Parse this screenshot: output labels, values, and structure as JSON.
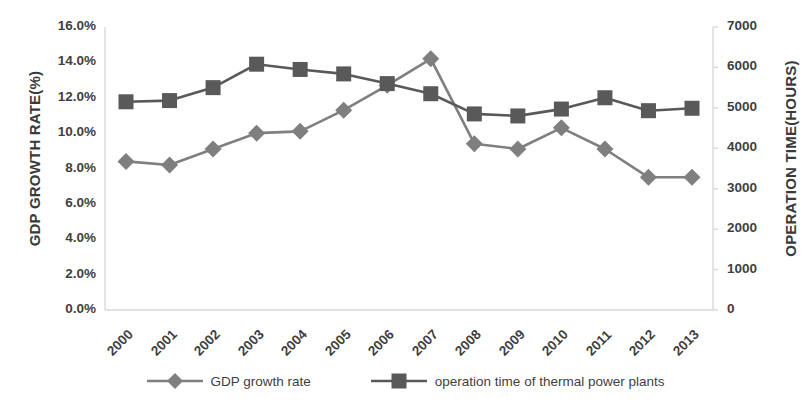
{
  "chart_data": {
    "type": "line",
    "title": "",
    "xlabel": "",
    "categories": [
      "2000",
      "2001",
      "2002",
      "2003",
      "2004",
      "2005",
      "2006",
      "2007",
      "2008",
      "2009",
      "2010",
      "2011",
      "2012",
      "2013"
    ],
    "grid": false,
    "legend_position": "bottom",
    "axes": {
      "left": {
        "label": "GDP GROWTH RATE(%)",
        "ticks": [
          "0.0%",
          "2.0%",
          "4.0%",
          "6.0%",
          "8.0%",
          "10.0%",
          "12.0%",
          "14.0%",
          "16.0%"
        ],
        "tick_values": [
          0,
          2,
          4,
          6,
          8,
          10,
          12,
          14,
          16
        ],
        "min": 0,
        "max": 16
      },
      "right": {
        "label": "OPERATION TIME(HOURS)",
        "ticks": [
          "0",
          "1000",
          "2000",
          "3000",
          "4000",
          "5000",
          "6000",
          "7000"
        ],
        "tick_values": [
          0,
          1000,
          2000,
          3000,
          4000,
          5000,
          6000,
          7000
        ],
        "min": 0,
        "max": 7000
      }
    },
    "series": [
      {
        "name": "GDP growth rate",
        "axis": "left",
        "marker": "diamond",
        "color": "#7f7f7f",
        "unit": "%",
        "values": [
          8.4,
          8.2,
          9.1,
          10.0,
          10.1,
          11.3,
          12.7,
          14.2,
          9.4,
          9.1,
          10.3,
          9.1,
          7.5,
          7.5
        ]
      },
      {
        "name": "operation time of thermal power plants",
        "axis": "right",
        "marker": "square",
        "color": "#595959",
        "unit": "hours",
        "values": [
          5150,
          5180,
          5500,
          6080,
          5950,
          5840,
          5600,
          5350,
          4850,
          4800,
          4970,
          5250,
          4930,
          4990
        ]
      }
    ]
  },
  "legend": {
    "items": [
      {
        "label": "GDP growth rate",
        "marker": "diamond",
        "color": "#7f7f7f"
      },
      {
        "label": "operation time of thermal power plants",
        "marker": "square",
        "color": "#595959"
      }
    ]
  }
}
